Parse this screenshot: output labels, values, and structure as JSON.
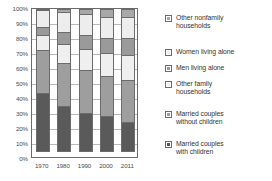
{
  "chart_data": {
    "type": "bar",
    "subtype": "stacked-percent",
    "title": "",
    "xlabel": "",
    "ylabel": "",
    "categories": [
      "1970",
      "1980",
      "1990",
      "2000",
      "2011"
    ],
    "ylim": [
      0,
      100
    ],
    "ytick_labels": [
      "0%",
      "10%",
      "20%",
      "30%",
      "40%",
      "50%",
      "60%",
      "70%",
      "80%",
      "90%",
      "100%"
    ],
    "ytick_values": [
      0,
      10,
      20,
      30,
      40,
      50,
      60,
      70,
      80,
      90,
      100
    ],
    "grid": true,
    "legend_position": "right",
    "series": [
      {
        "name": "Married couples with children",
        "color": "#5a5a5a",
        "values": [
          40,
          31,
          26,
          24,
          20
        ]
      },
      {
        "name": "Married couples without children",
        "color": "#9e9e9e",
        "values": [
          30,
          30,
          30,
          28,
          29
        ]
      },
      {
        "name": "Other family households",
        "color": "#efefef",
        "values": [
          11,
          13,
          15,
          16,
          18
        ]
      },
      {
        "name": "Men living alone",
        "color": "#9a9a9a",
        "values": [
          6,
          9,
          10,
          11,
          12
        ]
      },
      {
        "name": "Women living alone",
        "color": "#ededed",
        "values": [
          12,
          14,
          15,
          15,
          15
        ]
      },
      {
        "name": "Other nonfamily households",
        "color": "#a8a8a8",
        "values": [
          1,
          3,
          4,
          6,
          6
        ]
      }
    ]
  },
  "legend": {
    "items": [
      {
        "label": "Other nonfamily\nhouseholds",
        "swatch": "#a8a8a8",
        "name": "other-nonfamily-households"
      },
      {
        "label": "Women living alone",
        "swatch": "#ededed",
        "name": "women-living-alone"
      },
      {
        "label": "Men living alone",
        "swatch": "#9a9a9a",
        "name": "men-living-alone"
      },
      {
        "label": "Other family\nhouseholds",
        "swatch": "#efefef",
        "name": "other-family-households"
      },
      {
        "label": "Married couples\nwithout children",
        "swatch": "#9e9e9e",
        "name": "married-couples-without-children"
      },
      {
        "label": "Married couples\nwith children",
        "swatch": "#5a5a5a",
        "name": "married-couples-with-children"
      }
    ]
  },
  "colors": {
    "axis": "#6b6b6b",
    "grid": "#b9b9b9",
    "text": "#4a4a4a",
    "legend_text": "#333333",
    "background": "#ffffff"
  }
}
